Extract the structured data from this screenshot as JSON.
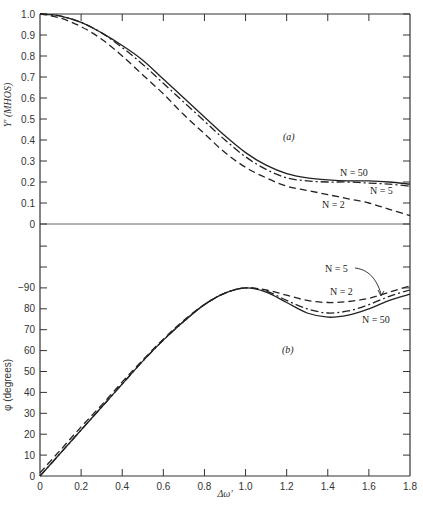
{
  "chart_data": [
    {
      "panel": "(a)",
      "type": "line",
      "title": "",
      "xlabel": "Δω'",
      "ylabel": "Y' (MHOS)",
      "xlim": [
        0,
        1.8
      ],
      "ylim": [
        0,
        1.0
      ],
      "grid": false,
      "x_ticks": [
        0,
        0.2,
        0.4,
        0.6,
        0.8,
        1.0,
        1.2,
        1.4,
        1.6,
        1.8
      ],
      "y_ticks": [
        "0",
        "0.1",
        "0.2",
        "0.3",
        "0.4",
        "0.5",
        "0.6",
        "0.7",
        "0.8",
        "0.9",
        "1.0"
      ],
      "x": [
        0,
        0.1,
        0.2,
        0.3,
        0.4,
        0.5,
        0.6,
        0.7,
        0.8,
        0.9,
        1.0,
        1.1,
        1.2,
        1.3,
        1.4,
        1.5,
        1.6,
        1.7,
        1.8
      ],
      "series": [
        {
          "name": "N = 50",
          "style": "solid",
          "values": [
            1.0,
            0.99,
            0.96,
            0.91,
            0.85,
            0.78,
            0.69,
            0.6,
            0.51,
            0.42,
            0.34,
            0.28,
            0.24,
            0.22,
            0.21,
            0.205,
            0.205,
            0.2,
            0.19
          ]
        },
        {
          "name": "N = 5",
          "style": "dash-dot",
          "values": [
            1.0,
            0.99,
            0.96,
            0.91,
            0.84,
            0.76,
            0.67,
            0.58,
            0.49,
            0.4,
            0.32,
            0.26,
            0.22,
            0.205,
            0.2,
            0.2,
            0.195,
            0.19,
            0.18
          ]
        },
        {
          "name": "N = 2",
          "style": "dashed",
          "values": [
            1.0,
            0.98,
            0.94,
            0.88,
            0.8,
            0.71,
            0.62,
            0.52,
            0.43,
            0.34,
            0.27,
            0.22,
            0.18,
            0.16,
            0.14,
            0.12,
            0.1,
            0.07,
            0.04
          ]
        }
      ],
      "annotations": [
        "(a)",
        "N = 50",
        "N = 5",
        "N = 2"
      ]
    },
    {
      "panel": "(b)",
      "type": "line",
      "title": "",
      "xlabel": "Δω'",
      "ylabel": "φ (degrees)",
      "xlim": [
        0,
        1.8
      ],
      "ylim": [
        0,
        110
      ],
      "grid": false,
      "x_ticks": [
        0,
        0.2,
        0.4,
        0.6,
        0.8,
        1.0,
        1.2,
        1.4,
        1.6,
        1.8
      ],
      "y_ticks": [
        "0",
        "10",
        "20",
        "30",
        "40",
        "50",
        "60",
        "70",
        "80",
        "−90"
      ],
      "x": [
        0,
        0.1,
        0.2,
        0.3,
        0.4,
        0.5,
        0.6,
        0.7,
        0.8,
        0.9,
        1.0,
        1.1,
        1.2,
        1.3,
        1.4,
        1.5,
        1.6,
        1.7,
        1.8
      ],
      "series": [
        {
          "name": "N = 50",
          "style": "solid",
          "values": [
            0,
            11,
            22,
            33,
            44,
            55,
            65,
            74,
            82,
            87.5,
            90,
            88,
            83,
            78,
            76,
            77,
            80,
            84,
            87
          ]
        },
        {
          "name": "N = 5",
          "style": "dash-dot",
          "values": [
            0,
            11,
            22,
            33,
            44,
            55,
            65,
            74,
            82,
            87.5,
            90,
            88.5,
            84,
            80,
            78,
            79,
            82,
            86,
            89
          ]
        },
        {
          "name": "N = 2",
          "style": "dashed",
          "values": [
            1.5,
            12.5,
            23.5,
            34,
            45,
            55.5,
            65.5,
            74.5,
            82,
            87.5,
            90,
            89,
            86.5,
            84,
            83,
            83.5,
            85,
            88,
            91
          ]
        }
      ],
      "annotations": [
        "(b)",
        "N = 5",
        "N = 2",
        "N = 50"
      ]
    }
  ],
  "labels": {
    "x_axis": "Δω'",
    "upper_y_axis": "Y' (MHOS)",
    "lower_y_axis": "φ (degrees)",
    "panel_a": "(a)",
    "panel_b": "(b)",
    "a_n50": "N = 50",
    "a_n5": "N = 5",
    "a_n2": "N = 2",
    "b_n5": "N = 5",
    "b_n2": "N = 2",
    "b_n50": "N = 50"
  }
}
